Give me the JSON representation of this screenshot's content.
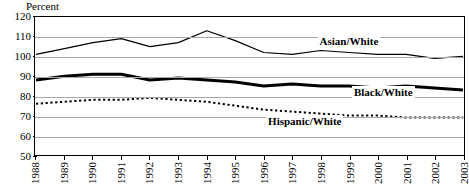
{
  "chart_data": {
    "type": "line",
    "title": "",
    "ylabel": "Percent",
    "xlabel": "",
    "ylim": [
      50,
      120
    ],
    "yticks": [
      50,
      60,
      70,
      80,
      90,
      100,
      110,
      120
    ],
    "grid": true,
    "legend_position": "inline-labels",
    "categories": [
      "1988",
      "1989",
      "1990",
      "1991",
      "1992",
      "1993",
      "1994",
      "1995",
      "1996",
      "1997",
      "1998",
      "1999",
      "2000",
      "2001",
      "2002",
      "2003"
    ],
    "series": [
      {
        "name": "Asian/White",
        "style": "thin-solid",
        "color": "#000000",
        "values": [
          101,
          104,
          107,
          109,
          105,
          107,
          113,
          108,
          102,
          101,
          103,
          102,
          101,
          101,
          99,
          100
        ]
      },
      {
        "name": "Black/White",
        "style": "thick-solid",
        "color": "#000000",
        "values": [
          88,
          90,
          91,
          91,
          88,
          89,
          88,
          87,
          85,
          86,
          85,
          85,
          84,
          85,
          84,
          83
        ]
      },
      {
        "name": "Hispanic/White",
        "style": "dotted",
        "color": "#000000",
        "values": [
          76,
          77,
          78,
          78,
          79,
          78,
          77,
          75,
          73,
          72,
          71,
          70,
          70,
          69,
          69,
          69
        ]
      }
    ],
    "annotations": [
      {
        "text": "Asian/White",
        "series": "Asian/White"
      },
      {
        "text": "Black/White",
        "series": "Black/White"
      },
      {
        "text": "Hispanic/White",
        "series": "Hispanic/White"
      }
    ]
  },
  "axis": {
    "y_title": "Percent"
  }
}
